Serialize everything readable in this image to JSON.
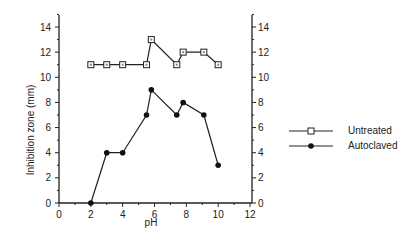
{
  "chart_data": {
    "type": "line",
    "title": "",
    "xlabel": "pH",
    "ylabel": "Inhibition zone (mm)",
    "xlim": [
      0,
      12
    ],
    "ylim": [
      0,
      15
    ],
    "xticks": [
      0,
      2,
      4,
      6,
      8,
      10,
      12
    ],
    "yticks": [
      0,
      2,
      4,
      6,
      8,
      10,
      12,
      14
    ],
    "grid": false,
    "legend_position": "right",
    "x": [
      2,
      3,
      4,
      5.5,
      5.8,
      7.4,
      7.8,
      9.1,
      10
    ],
    "series": [
      {
        "name": "Untreated",
        "marker": "open-square",
        "values": [
          11,
          11,
          11,
          11,
          13,
          11,
          12,
          12,
          11
        ]
      },
      {
        "name": "Autoclaved",
        "marker": "filled-diamond",
        "values": [
          0,
          4,
          4,
          7,
          9,
          7,
          8,
          7,
          3
        ]
      }
    ]
  },
  "legend": {
    "items": [
      {
        "label": "Untreated"
      },
      {
        "label": "Autoclaved"
      }
    ]
  },
  "axes": {
    "xlabel": "pH",
    "ylabel": "Inhibition zone (mm)",
    "xtick_labels": [
      "0",
      "2",
      "4",
      "6",
      "8",
      "10",
      "12"
    ],
    "ytick_labels": [
      "0",
      "2",
      "4",
      "6",
      "8",
      "10",
      "12",
      "14"
    ]
  }
}
